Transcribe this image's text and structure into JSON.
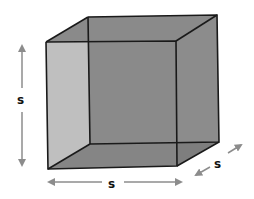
{
  "diagram": {
    "labels": {
      "height": "s",
      "width": "s",
      "depth": "s"
    },
    "colors": {
      "face_fill": "#8a8a8a",
      "edge": "#1a1a1a",
      "arrow": "#8c8c8c",
      "background": "#ffffff"
    }
  }
}
